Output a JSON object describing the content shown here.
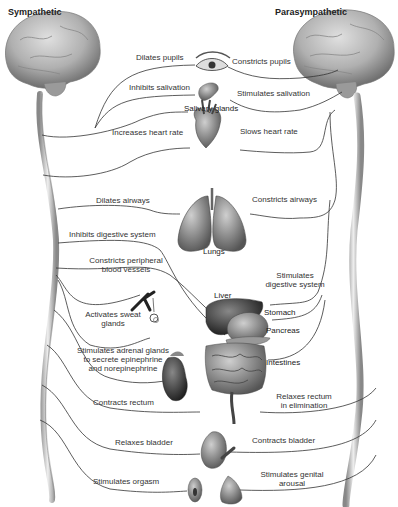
{
  "titles": {
    "left": "Sympathetic",
    "right": "Parasympathetic"
  },
  "organs": {
    "eye": "eye",
    "salivary": "Salivary glands",
    "heart": "heart",
    "lungs": "Lungs",
    "liver": "Liver",
    "stomach": "Stomach",
    "pancreas": "Pancreas",
    "intestines": "Intestines",
    "blood_vessels": "blood vessels",
    "sweat_glands": "sweat glands",
    "adrenal": "adrenal gland / kidney",
    "bladder": "bladder",
    "genitals": "genitals"
  },
  "sympathetic": {
    "pupils": "Dilates pupils",
    "salivation": "Inhibits salivation",
    "heart": "Increases heart rate",
    "airways": "Dilates airways",
    "digestive": "Inhibits digestive system",
    "vessels_1": "Constricts peripheral",
    "vessels_2": "blood vessels",
    "sweat_1": "Activates sweat",
    "sweat_2": "glands",
    "adrenal_1": "Stimulates adrenal glands",
    "adrenal_2": "to secrete epinephrine",
    "adrenal_3": "and norepinephrine",
    "rectum": "Contracts rectum",
    "bladder": "Relaxes bladder",
    "orgasm": "Stimulates orgasm"
  },
  "parasympathetic": {
    "pupils": "Constricts pupils",
    "salivation": "Stimulates salivation",
    "heart": "Slows heart rate",
    "airways": "Constricts airways",
    "digestive_1": "Stimulates",
    "digestive_2": "digestive system",
    "rectum_1": "Relaxes rectum",
    "rectum_2": "in elimination",
    "bladder": "Contracts bladder",
    "genital_1": "Stimulates genital",
    "genital_2": "arousal"
  },
  "colors": {
    "nerve_line": "#333333",
    "brain": "#b5b5b5",
    "spine": "#c8c8c8",
    "organ_dark": "#3a3a3a",
    "organ_mid": "#7a7a7a"
  }
}
